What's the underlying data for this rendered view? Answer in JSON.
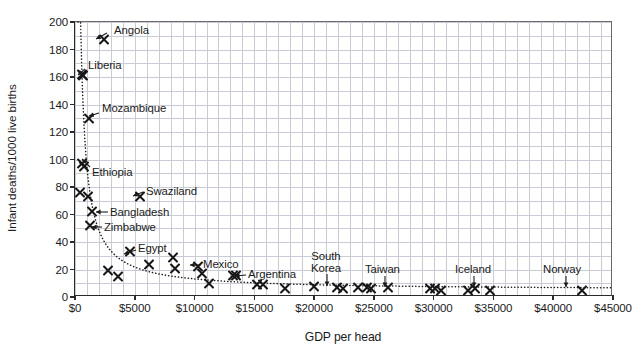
{
  "chart_data": {
    "type": "scatter",
    "title": "",
    "xlabel": "GDP per head",
    "ylabel": "Infant deaths/1000 live births",
    "xlim": [
      0,
      45000
    ],
    "ylim": [
      0,
      200
    ],
    "xticks": [
      0,
      5000,
      10000,
      15000,
      20000,
      25000,
      30000,
      35000,
      40000,
      45000
    ],
    "xticklabels": [
      "$0",
      "$5000",
      "$10000",
      "$15000",
      "$20000",
      "$25000",
      "$30000",
      "$35000",
      "$40000",
      "$45000"
    ],
    "yticks": [
      0,
      20,
      40,
      60,
      80,
      100,
      120,
      140,
      160,
      180,
      200
    ],
    "yticklabels": [
      "0",
      "20",
      "40",
      "60",
      "80",
      "100",
      "120",
      "140",
      "160",
      "180",
      "200"
    ],
    "grid": true,
    "grid_minor_x": 1000,
    "grid_minor_y": 10,
    "legend": "none",
    "marker": "x",
    "trendline": {
      "style": "dotted",
      "description": "decaying power-law fit through the cloud"
    },
    "points": [
      {
        "label": "Angola",
        "x": 2400,
        "y": 187
      },
      {
        "label": "Liberia",
        "x": 550,
        "y": 162
      },
      {
        "label": "",
        "x": 700,
        "y": 161
      },
      {
        "label": "Mozambique",
        "x": 1150,
        "y": 130
      },
      {
        "label": "Ethiopia",
        "x": 600,
        "y": 97
      },
      {
        "label": "",
        "x": 750,
        "y": 95
      },
      {
        "label": "",
        "x": 400,
        "y": 76
      },
      {
        "label": "",
        "x": 1050,
        "y": 73
      },
      {
        "label": "Bangladesh",
        "x": 1400,
        "y": 62
      },
      {
        "label": "Zimbabwe",
        "x": 1250,
        "y": 52
      },
      {
        "label": "Swaziland",
        "x": 5400,
        "y": 73
      },
      {
        "label": "",
        "x": 2800,
        "y": 19
      },
      {
        "label": "",
        "x": 3600,
        "y": 15
      },
      {
        "label": "Egypt",
        "x": 4600,
        "y": 33
      },
      {
        "label": "",
        "x": 6200,
        "y": 24
      },
      {
        "label": "",
        "x": 8200,
        "y": 29
      },
      {
        "label": "",
        "x": 8400,
        "y": 21
      },
      {
        "label": "",
        "x": 10300,
        "y": 22
      },
      {
        "label": "Mexico",
        "x": 10600,
        "y": 17
      },
      {
        "label": "",
        "x": 11200,
        "y": 10
      },
      {
        "label": "Argentina",
        "x": 13200,
        "y": 16
      },
      {
        "label": "",
        "x": 13500,
        "y": 16
      },
      {
        "label": "",
        "x": 15200,
        "y": 9
      },
      {
        "label": "",
        "x": 15700,
        "y": 9
      },
      {
        "label": "",
        "x": 17600,
        "y": 6
      },
      {
        "label": "",
        "x": 20000,
        "y": 8
      },
      {
        "label": "South Korea",
        "x": 21900,
        "y": 7
      },
      {
        "label": "",
        "x": 22400,
        "y": 6
      },
      {
        "label": "",
        "x": 23700,
        "y": 7
      },
      {
        "label": "",
        "x": 24400,
        "y": 7
      },
      {
        "label": "",
        "x": 24800,
        "y": 6
      },
      {
        "label": "Taiwan",
        "x": 26200,
        "y": 7
      },
      {
        "label": "",
        "x": 29700,
        "y": 6
      },
      {
        "label": "",
        "x": 30100,
        "y": 6
      },
      {
        "label": "",
        "x": 30600,
        "y": 5
      },
      {
        "label": "",
        "x": 32900,
        "y": 5
      },
      {
        "label": "",
        "x": 33500,
        "y": 6
      },
      {
        "label": "Iceland",
        "x": 34700,
        "y": 5
      },
      {
        "label": "Norway",
        "x": 42400,
        "y": 5
      }
    ],
    "annotations": [
      {
        "text": "Angola",
        "style": "arrow-left",
        "lines": [
          "Angola"
        ]
      },
      {
        "text": "Liberia",
        "style": "arrow-left",
        "lines": [
          "Liberia"
        ]
      },
      {
        "text": "Mozambique",
        "style": "arrow-left",
        "lines": [
          "Mozambique"
        ]
      },
      {
        "text": "Ethiopia",
        "style": "arrow-up",
        "lines": [
          "Ethiopia"
        ]
      },
      {
        "text": "Swaziland",
        "style": "arrow-left",
        "lines": [
          "Swaziland"
        ]
      },
      {
        "text": "Bangladesh",
        "style": "arrow-left",
        "lines": [
          "Bangladesh"
        ]
      },
      {
        "text": "Zimbabwe",
        "style": "arrow-left",
        "lines": [
          "Zimbabwe"
        ]
      },
      {
        "text": "Egypt",
        "style": "arrow-left",
        "lines": [
          "Egypt"
        ]
      },
      {
        "text": "Mexico",
        "style": "arrow-left",
        "lines": [
          "Mexico"
        ]
      },
      {
        "text": "Argentina",
        "style": "arrow-left",
        "lines": [
          "Argentina"
        ]
      },
      {
        "text": "South Korea",
        "style": "arrow-down",
        "lines": [
          "South",
          "Korea"
        ]
      },
      {
        "text": "Taiwan",
        "style": "arrow-down",
        "lines": [
          "Taiwan"
        ]
      },
      {
        "text": "Iceland",
        "style": "arrow-down",
        "lines": [
          "Iceland"
        ]
      },
      {
        "text": "Norway",
        "style": "arrow-down",
        "lines": [
          "Norway"
        ]
      }
    ]
  },
  "axes": {
    "x_title": "GDP per head",
    "y_title": "Infant deaths/1000 live births"
  },
  "labels": {
    "angola": "Angola",
    "liberia": "Liberia",
    "mozambique": "Mozambique",
    "ethiopia": "Ethiopia",
    "swaziland": "Swaziland",
    "bangladesh": "Bangladesh",
    "zimbabwe": "Zimbabwe",
    "egypt": "Egypt",
    "mexico": "Mexico",
    "argentina": "Argentina",
    "south": "South",
    "korea": "Korea",
    "taiwan": "Taiwan",
    "iceland": "Iceland",
    "norway": "Norway"
  },
  "colors": {
    "marker": "#171717",
    "grid": "#c9ccd4",
    "axis": "#2a2a2a",
    "text": "#1a1a1a",
    "background": "#ffffff"
  }
}
